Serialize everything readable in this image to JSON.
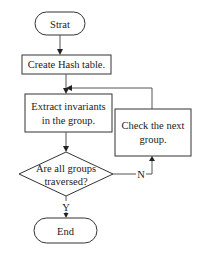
{
  "diagram": {
    "type": "flowchart",
    "nodes": {
      "start": {
        "shape": "terminator",
        "label": "Strat"
      },
      "create": {
        "shape": "process",
        "label": "Create Hash table."
      },
      "extract": {
        "shape": "process",
        "line1": "Extract invariants",
        "line2": "in the group."
      },
      "decision": {
        "shape": "decision",
        "line1": "Are all groups",
        "line2": "traversed?"
      },
      "check": {
        "shape": "process",
        "line1": "Check the next",
        "line2": "group."
      },
      "end": {
        "shape": "terminator",
        "label": "End"
      }
    },
    "edges": [
      {
        "from": "start",
        "to": "create",
        "label": ""
      },
      {
        "from": "create",
        "to": "extract",
        "label": ""
      },
      {
        "from": "extract",
        "to": "decision",
        "label": ""
      },
      {
        "from": "decision",
        "to": "end",
        "label": "Y"
      },
      {
        "from": "decision",
        "to": "check",
        "label": "N"
      },
      {
        "from": "check",
        "to": "extract",
        "label": ""
      }
    ],
    "edge_labels": {
      "yes": "Y",
      "no": "N"
    }
  }
}
